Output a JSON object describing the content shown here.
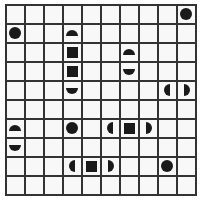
{
  "puzzle": {
    "type": "battleship-grid",
    "rows": 10,
    "cols": 10,
    "colors": {
      "grid_line": "#333333",
      "cell_bg": "#f8f8f8",
      "piece": "#1a1a1a"
    },
    "pieces": [
      {
        "row": 0,
        "col": 9,
        "shape": "circle"
      },
      {
        "row": 1,
        "col": 0,
        "shape": "circle"
      },
      {
        "row": 1,
        "col": 3,
        "shape": "half-top"
      },
      {
        "row": 2,
        "col": 3,
        "shape": "square"
      },
      {
        "row": 2,
        "col": 6,
        "shape": "half-top"
      },
      {
        "row": 3,
        "col": 3,
        "shape": "square"
      },
      {
        "row": 3,
        "col": 6,
        "shape": "half-bottom"
      },
      {
        "row": 4,
        "col": 3,
        "shape": "half-bottom"
      },
      {
        "row": 4,
        "col": 8,
        "shape": "half-left"
      },
      {
        "row": 4,
        "col": 9,
        "shape": "half-right"
      },
      {
        "row": 6,
        "col": 0,
        "shape": "half-top"
      },
      {
        "row": 6,
        "col": 3,
        "shape": "circle"
      },
      {
        "row": 6,
        "col": 5,
        "shape": "half-left"
      },
      {
        "row": 6,
        "col": 6,
        "shape": "square"
      },
      {
        "row": 6,
        "col": 7,
        "shape": "half-right"
      },
      {
        "row": 7,
        "col": 0,
        "shape": "half-bottom"
      },
      {
        "row": 8,
        "col": 3,
        "shape": "half-left"
      },
      {
        "row": 8,
        "col": 4,
        "shape": "square"
      },
      {
        "row": 8,
        "col": 5,
        "shape": "half-right"
      },
      {
        "row": 8,
        "col": 8,
        "shape": "circle"
      }
    ]
  }
}
